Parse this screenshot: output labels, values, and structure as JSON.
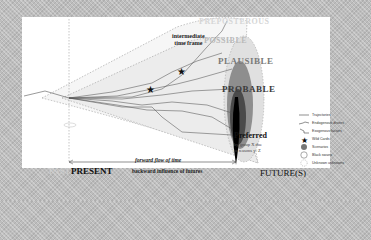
{
  "diagram": {
    "cone_levels": [
      {
        "label": "PREPOSTEROUS",
        "shade": "#d6d6d6"
      },
      {
        "label": "POSSIBLE",
        "shade": "#b9b9b9"
      },
      {
        "label": "PLAUSIBLE",
        "shade": "#7a7a7a"
      },
      {
        "label": "PROBABLE",
        "shade": "#3a3a3a"
      }
    ],
    "annotations": {
      "intermediate_line1": "intermediate",
      "intermediate_line2": "time frame",
      "preferred": "Preferred",
      "preferred_sub_line1": "by group X due",
      "preferred_sub_line2": "to reasons y+Z",
      "forward_flow": "forward flow of time",
      "backward_influence": "backward influence of futures"
    },
    "timeline": {
      "past": "PAST",
      "present": "PRESENT",
      "futures": "FUTURE(S)"
    },
    "legend": [
      {
        "icon": "trajectory-line-icon",
        "label": "Trajectories"
      },
      {
        "icon": "endogenous-driver-icon",
        "label": "Endogenous drivers"
      },
      {
        "icon": "exogenous-factor-icon",
        "label": "Exogenous factors"
      },
      {
        "icon": "wild-card-star-icon",
        "label": "Wild Cards"
      },
      {
        "icon": "scenario-dot-icon",
        "label": "Scenarios"
      },
      {
        "icon": "black-swan-circle-icon",
        "label": "Black swans"
      },
      {
        "icon": "unknown-unknown-dashed-circle-icon",
        "label": "Unknown unknowns"
      }
    ],
    "colors": {
      "background": "#bdbdbd",
      "panel": "#ffffff",
      "probable": "#3a3a3a",
      "plausible": "#7a7a7a",
      "possible": "#cfcfcf",
      "preferred_spike": "#000000"
    }
  }
}
